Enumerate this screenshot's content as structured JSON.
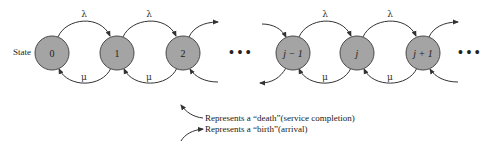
{
  "diagram": {
    "type": "birth-death process state transition diagram",
    "row_label": "State",
    "nodes": [
      {
        "id": "0",
        "label": "0",
        "italic": false
      },
      {
        "id": "1",
        "label": "1",
        "italic": false
      },
      {
        "id": "2",
        "label": "2",
        "italic": false
      },
      {
        "id": "j-1",
        "label": "j − 1",
        "italic": true
      },
      {
        "id": "j",
        "label": "j",
        "italic": true
      },
      {
        "id": "j+1",
        "label": "j + 1",
        "italic": true
      }
    ],
    "ellipsis": "• • •",
    "birth_rate_symbol": "λ",
    "death_rate_symbol": "μ",
    "arcs": [
      {
        "from": "0",
        "to": "1",
        "label": "λ",
        "kind": "birth"
      },
      {
        "from": "1",
        "to": "0",
        "label": "μ",
        "kind": "death"
      },
      {
        "from": "1",
        "to": "2",
        "label": "λ",
        "kind": "birth"
      },
      {
        "from": "2",
        "to": "1",
        "label": "μ",
        "kind": "death"
      },
      {
        "from": "j-1",
        "to": "j",
        "label": "λ",
        "kind": "birth"
      },
      {
        "from": "j",
        "to": "j-1",
        "label": "μ",
        "kind": "death"
      },
      {
        "from": "j",
        "to": "j+1",
        "label": "λ",
        "kind": "birth"
      },
      {
        "from": "j+1",
        "to": "j",
        "label": "μ",
        "kind": "death"
      }
    ],
    "legend": {
      "death_text": "Represents a “death”(service completion)",
      "birth_text": "Represents a “birth”(arrival)"
    },
    "colors": {
      "node_fill": "#a4a4a4",
      "node_stroke": "#4a4a4a",
      "arc_stroke": "#333333",
      "text": "#222222"
    }
  }
}
